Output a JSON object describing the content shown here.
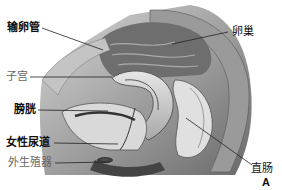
{
  "diagram": {
    "figure_letter": "A",
    "labels": [
      {
        "id": "fallopian-tube",
        "text": "输卵管"
      },
      {
        "id": "ovary",
        "text": "卵巢"
      },
      {
        "id": "uterus",
        "text": "子宫"
      },
      {
        "id": "bladder",
        "text": "膀胱"
      },
      {
        "id": "female-urethra",
        "text": "女性尿道"
      },
      {
        "id": "external-genitalia",
        "text": "外生殖器"
      },
      {
        "id": "rectum",
        "text": "直肠"
      }
    ]
  },
  "colors": {
    "background": "#ffffff",
    "tissue_dark": "#3a3a3a",
    "tissue_mid": "#8a8a8a",
    "tissue_light": "#cfcfcf",
    "leader_line": "#222222"
  }
}
